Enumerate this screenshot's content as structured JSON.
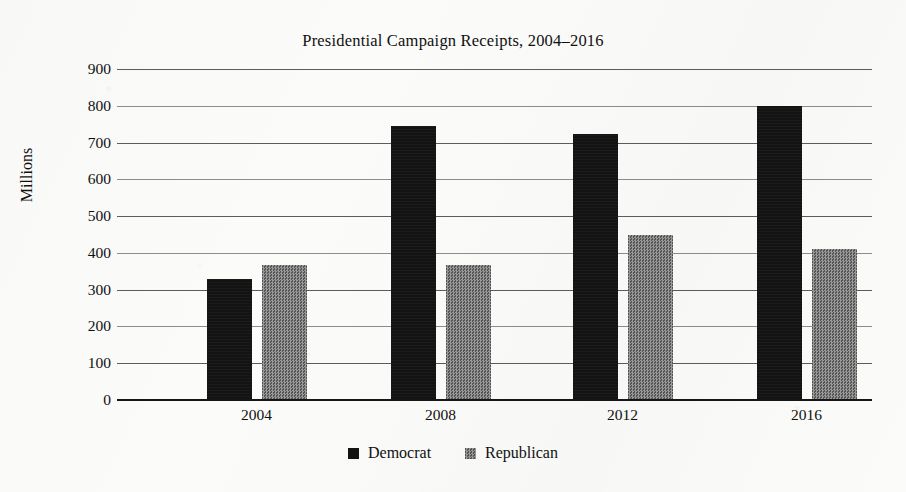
{
  "chart_data": {
    "type": "bar",
    "title": "Presidential Campaign Receipts, 2004–2016",
    "xlabel": "",
    "ylabel": "Millions",
    "categories": [
      "2004",
      "2008",
      "2012",
      "2016"
    ],
    "series": [
      {
        "name": "Democrat",
        "color": "#131313",
        "values": [
          330,
          745,
          723,
          800
        ]
      },
      {
        "name": "Republican",
        "color": "#6d6d6d",
        "values": [
          367,
          368,
          450,
          410
        ]
      }
    ],
    "ylim": [
      0,
      900
    ],
    "ytick_labels": [
      "900",
      "800",
      "700",
      "600",
      "500",
      "400",
      "300",
      "200",
      "100",
      "0"
    ],
    "ytick_values": [
      900,
      800,
      700,
      600,
      500,
      400,
      300,
      200,
      100,
      0
    ],
    "grid": true,
    "grid_axis": "y",
    "legend_position": "bottom",
    "legend": [
      "Democrat",
      "Republican"
    ],
    "background_color": "#fbfbfa"
  }
}
